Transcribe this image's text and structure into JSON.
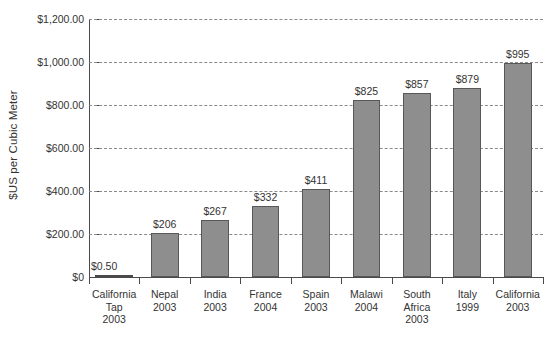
{
  "chart_data": {
    "type": "bar",
    "title": "",
    "xlabel": "",
    "ylabel": "$US per Cubic Meter",
    "ylim": [
      0,
      1200
    ],
    "grid": true,
    "legend": "none",
    "y_ticks": [
      {
        "value": 1200,
        "label": "$1,200.00"
      },
      {
        "value": 1000,
        "label": "$1,000.00"
      },
      {
        "value": 800,
        "label": "$800.00"
      },
      {
        "value": 600,
        "label": "$600.00"
      },
      {
        "value": 400,
        "label": "$400.00"
      },
      {
        "value": 200,
        "label": "$200.00"
      },
      {
        "value": 0,
        "label": "$0"
      }
    ],
    "categories": [
      "California Tap 2003",
      "Nepal 2003",
      "India 2003",
      "France 2004",
      "Spain 2003",
      "Malawi 2004",
      "South Africa 2003",
      "Italy 1999",
      "California 2003"
    ],
    "category_lines": [
      [
        "California",
        "Tap",
        "2003"
      ],
      [
        "Nepal",
        "2003"
      ],
      [
        "India",
        "2003"
      ],
      [
        "France",
        "2004"
      ],
      [
        "Spain",
        "2003"
      ],
      [
        "Malawi",
        "2004"
      ],
      [
        "South",
        "Africa",
        "2003"
      ],
      [
        "Italy",
        "1999"
      ],
      [
        "California",
        "2003"
      ]
    ],
    "values": [
      0.5,
      206,
      267,
      332,
      411,
      825,
      857,
      879,
      995
    ],
    "value_labels": [
      "$0.50",
      "$206",
      "$267",
      "$332",
      "$411",
      "$825",
      "$857",
      "$879",
      "$995"
    ],
    "colors": {
      "bar_fill": "#8e8e8e",
      "bar_stroke": "#585858",
      "axis": "#4a4a4a",
      "grid": "#8a8a8a",
      "text": "#333333",
      "background": "#ffffff"
    }
  }
}
